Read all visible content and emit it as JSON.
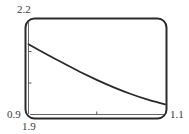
{
  "chart_data": {
    "type": "line",
    "title": "",
    "xlabel": "",
    "ylabel": "",
    "xlim": [
      0.9,
      1.1
    ],
    "ylim": [
      1.9,
      2.2
    ],
    "window_labels": {
      "ymax": "2.2",
      "xmin": "0.9",
      "ymin": "1.9",
      "xmax": "1.1"
    },
    "x_ticks": [
      1.0
    ],
    "y_ticks": [
      2.0,
      2.1
    ],
    "grid": false,
    "legend": null,
    "series": [
      {
        "name": "curve",
        "x": [
          0.9,
          0.925,
          0.95,
          0.975,
          1.0,
          1.025,
          1.05,
          1.075,
          1.1
        ],
        "y": [
          2.123,
          2.093,
          2.064,
          2.036,
          2.01,
          1.986,
          1.965,
          1.947,
          1.932
        ]
      }
    ],
    "frame": "rounded-rectangle calculator screen"
  },
  "colors": {
    "frame": "#2a2a2a",
    "curve": "#2a2a2a",
    "axis": "#555555",
    "background": "#ffffff"
  }
}
